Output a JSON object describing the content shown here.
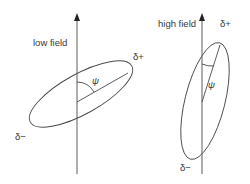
{
  "panels": [
    {
      "id": "low",
      "title": "low field",
      "angle_label": "ψ",
      "positive_label": "δ+",
      "negative_label": "δ−"
    },
    {
      "id": "high",
      "title": "high field",
      "angle_label": "ψ",
      "positive_label": "δ+",
      "negative_label": "δ−"
    }
  ],
  "colors": {
    "line": "#4a4a4a",
    "text": "#3a3a3a",
    "background": "#ffffff"
  }
}
